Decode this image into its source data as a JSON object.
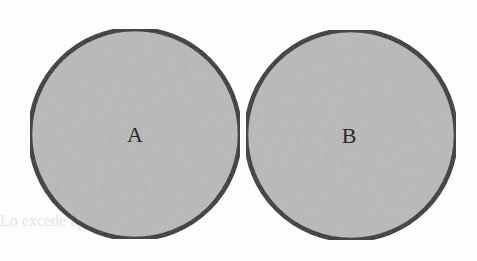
{
  "diagram": {
    "type": "two disjoint circles (sets)",
    "fill_color": "#b8b8b8",
    "stroke_color": "#2b2b2b",
    "background_color": "#fdfdfc",
    "circles": [
      {
        "label": "A",
        "cx": 135,
        "cy": 134,
        "r": 105
      },
      {
        "label": "B",
        "cx": 351,
        "cy": 135,
        "r": 105
      }
    ]
  },
  "bleed_text": "Lo excede ... apropiadi... ... ...uas re"
}
